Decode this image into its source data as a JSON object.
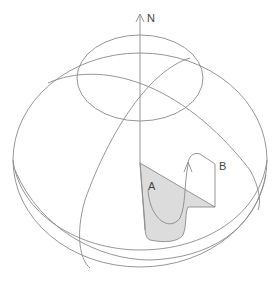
{
  "diagram": {
    "labels": {
      "north": "N",
      "point_a": "A",
      "point_b": "B"
    },
    "colors": {
      "stroke": "#8a8a8a",
      "shaded_region": "#dcdcdc",
      "text": "#444444",
      "background": "#ffffff"
    }
  }
}
